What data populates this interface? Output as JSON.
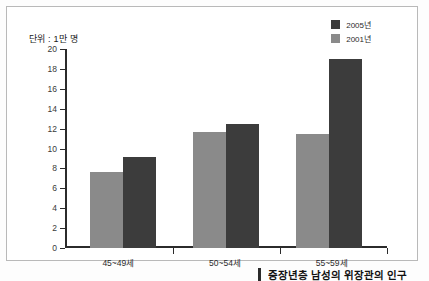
{
  "chart_data": {
    "type": "bar",
    "title": "",
    "unit_label": "단위 : 1만 명",
    "categories": [
      "45~49세",
      "50~54세",
      "55~59세"
    ],
    "series": [
      {
        "name": "2001년",
        "color": "#8a8a8a",
        "values": [
          7.6,
          11.7,
          11.5
        ]
      },
      {
        "name": "2005년",
        "color": "#3c3c3c",
        "values": [
          9.1,
          12.5,
          19.0
        ]
      }
    ],
    "xlabel": "",
    "ylabel": "",
    "ylim": [
      0,
      20
    ],
    "ytick_step": 2,
    "yticks": [
      "20",
      "18",
      "16",
      "14",
      "12",
      "10",
      "8",
      "6",
      "4",
      "2",
      "0"
    ],
    "grid": false,
    "legend_position": "top-right"
  },
  "legend": {
    "items": [
      {
        "label": "2005년",
        "color": "#3c3c3c"
      },
      {
        "label": "2001년",
        "color": "#8a8a8a"
      }
    ]
  },
  "caption": {
    "text": "중장년층 남성의 위장관의 인구"
  },
  "colors": {
    "series_dark": "#3c3c3c",
    "series_light": "#8a8a8a",
    "axis": "#2b2b2b",
    "frame": "#b9b9b9",
    "background": "#ffffff"
  }
}
